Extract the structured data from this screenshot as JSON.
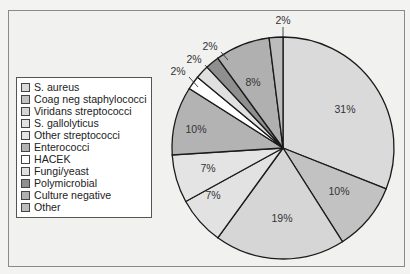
{
  "chart_data": {
    "type": "pie",
    "title": "",
    "legend_position": "left",
    "start_angle": "12 o'clock",
    "direction": "clockwise",
    "categories": [
      "S. aureus",
      "Coag neg staphylococci",
      "Viridans streptococci",
      "S. gallolyticus",
      "Other streptococci",
      "Enterococci",
      "HACEK",
      "Fungi/yeast",
      "Polymicrobial",
      "Culture negative",
      "Other"
    ],
    "values": [
      31,
      10,
      19,
      7,
      7,
      10,
      2,
      2,
      2,
      8,
      2
    ],
    "labels": [
      "31%",
      "10%",
      "19%",
      "7%",
      "7%",
      "10%",
      "2%",
      "2%",
      "2%",
      "8%",
      "2%"
    ],
    "colors": [
      "#dadada",
      "#c2c2c2",
      "#d6d6d6",
      "#e2e2e2",
      "#e4e4e4",
      "#b3b3b3",
      "#ffffff",
      "#e0e0e0",
      "#8f8f8f",
      "#b0b0b0",
      "#bcbcbc"
    ]
  },
  "legend": {
    "items": [
      {
        "label": "S. aureus",
        "color": "#dadada"
      },
      {
        "label": "Coag neg staphylococci",
        "color": "#c2c2c2"
      },
      {
        "label": "Viridans streptococci",
        "color": "#d6d6d6"
      },
      {
        "label": "S. gallolyticus",
        "color": "#e2e2e2"
      },
      {
        "label": "Other streptococci",
        "color": "#e4e4e4"
      },
      {
        "label": "Enterococci",
        "color": "#b3b3b3"
      },
      {
        "label": "HACEK",
        "color": "#ffffff"
      },
      {
        "label": "Fungi/yeast",
        "color": "#e0e0e0"
      },
      {
        "label": "Polymicrobial",
        "color": "#8f8f8f"
      },
      {
        "label": "Culture negative",
        "color": "#b0b0b0"
      },
      {
        "label": "Other",
        "color": "#bcbcbc"
      }
    ]
  }
}
